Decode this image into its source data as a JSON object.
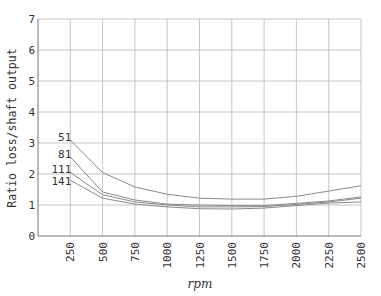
{
  "chart_data": {
    "type": "line",
    "title": "",
    "xlabel": "rpm",
    "ylabel": "Ratio loss/shaft output",
    "x": [
      250,
      500,
      750,
      1000,
      1250,
      1500,
      1750,
      2000,
      2250,
      2500
    ],
    "x_ticks": [
      "250",
      "500",
      "750",
      "1000",
      "1250",
      "1500",
      "1750",
      "2000",
      "2250",
      "2500"
    ],
    "y_ticks": [
      "0",
      "1",
      "2",
      "3",
      "4",
      "5",
      "6",
      "7"
    ],
    "xlim": [
      0,
      2500
    ],
    "ylim": [
      0,
      7
    ],
    "grid": true,
    "legend": "inline labels at left end of each curve",
    "series": [
      {
        "name": "51",
        "values": [
          3.1,
          2.05,
          1.58,
          1.35,
          1.22,
          1.19,
          1.19,
          1.28,
          1.45,
          1.62
        ]
      },
      {
        "name": "81",
        "values": [
          2.55,
          1.42,
          1.16,
          1.03,
          1.0,
          0.98,
          0.98,
          1.05,
          1.13,
          1.26
        ]
      },
      {
        "name": "111",
        "values": [
          2.05,
          1.33,
          1.1,
          1.0,
          0.94,
          0.94,
          0.95,
          1.02,
          1.1,
          1.22
        ]
      },
      {
        "name": "141",
        "values": [
          1.8,
          1.22,
          1.03,
          0.94,
          0.88,
          0.87,
          0.9,
          0.98,
          1.06,
          1.1
        ]
      }
    ]
  }
}
